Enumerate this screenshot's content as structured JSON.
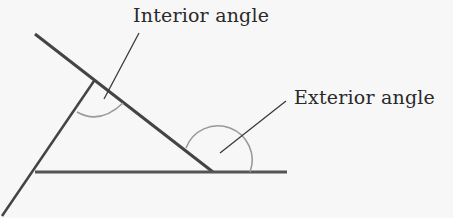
{
  "diagram": {
    "labels": {
      "interior": "Interior angle",
      "exterior": "Exterior angle"
    },
    "colors": {
      "background": "#f7f7f7",
      "lines": "#444444",
      "arcs": "#9a9a9a",
      "leaders": "#3a3a3a",
      "text": "#2a2a2a"
    }
  }
}
